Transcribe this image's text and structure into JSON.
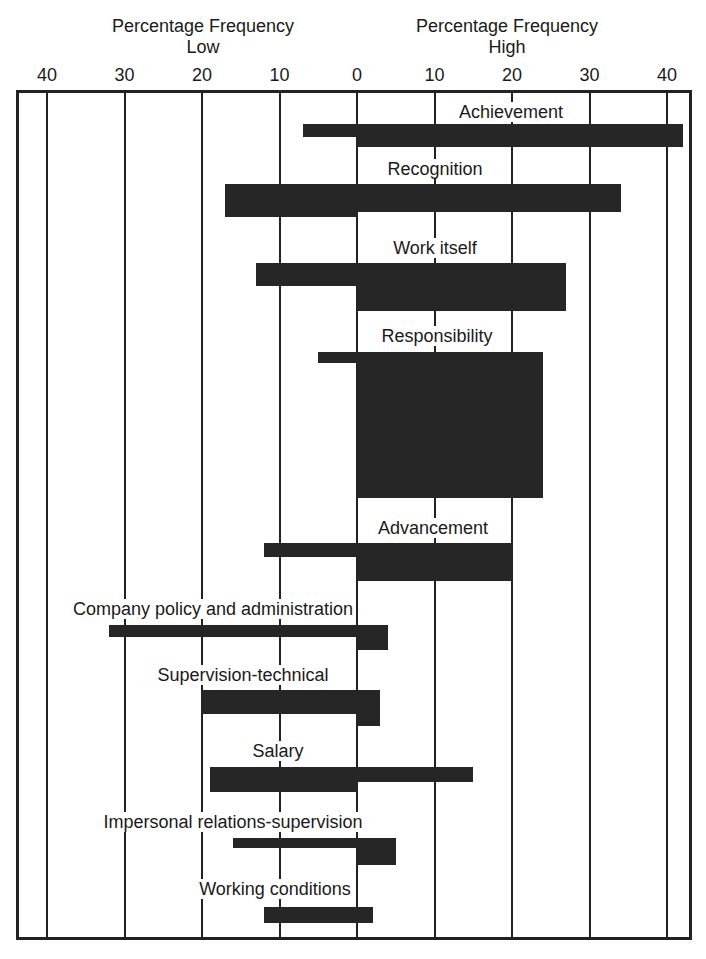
{
  "header": {
    "low_title_line1": "Percentage Frequency",
    "low_title_line2": "Low",
    "high_title_line1": "Percentage Frequency",
    "high_title_line2": "High"
  },
  "chart_data": {
    "type": "bar",
    "orientation": "horizontal-diverging",
    "title": "",
    "xlabel_left": "Percentage Frequency Low",
    "xlabel_right": "Percentage Frequency High",
    "tick_labels": [
      "40",
      "30",
      "20",
      "10",
      "0",
      "10",
      "20",
      "30",
      "40"
    ],
    "xlim_low": [
      0,
      40
    ],
    "xlim_high": [
      0,
      40
    ],
    "grid": true,
    "legend": null,
    "categories": [
      "Achievement",
      "Recognition",
      "Work itself",
      "Responsibility",
      "Advancement",
      "Company policy and administration",
      "Supervision-technical",
      "Salary",
      "Impersonal relations-supervision",
      "Working conditions"
    ],
    "series": [
      {
        "name": "Low",
        "values": [
          7,
          17,
          13,
          5,
          12,
          32,
          20,
          19,
          16,
          12
        ]
      },
      {
        "name": "High",
        "values": [
          42,
          34,
          27,
          24,
          20,
          4,
          3,
          15,
          5,
          2
        ]
      }
    ]
  },
  "bars": [
    {
      "label": "Achievement",
      "low": 7,
      "high": 42,
      "top": 124,
      "low_bottom": 137,
      "high_bottom": 147,
      "label_x": 511,
      "label_y": 102
    },
    {
      "label": "Recognition",
      "low": 17,
      "high": 34,
      "top": 184,
      "low_bottom": 217,
      "high_bottom": 212,
      "label_x": 435,
      "label_y": 159
    },
    {
      "label": "Work itself",
      "low": 13,
      "high": 27,
      "top": 263,
      "low_bottom": 286,
      "high_bottom": 311,
      "label_x": 435,
      "label_y": 238
    },
    {
      "label": "Responsibility",
      "low": 5,
      "high": 24,
      "top": 352,
      "low_bottom": 363,
      "high_bottom": 498,
      "label_x": 437,
      "label_y": 326
    },
    {
      "label": "Advancement",
      "low": 12,
      "high": 20,
      "top": 543,
      "low_bottom": 557,
      "high_bottom": 581,
      "label_x": 433,
      "label_y": 518
    },
    {
      "label": "Company policy and administration",
      "low": 32,
      "high": 4,
      "top": 625,
      "low_bottom": 637,
      "high_bottom": 650,
      "label_x": 213,
      "label_y": 599
    },
    {
      "label": "Supervision-technical",
      "low": 20,
      "high": 3,
      "top": 690,
      "low_bottom": 714,
      "high_bottom": 726,
      "label_x": 243,
      "label_y": 665
    },
    {
      "label": "Salary",
      "low": 19,
      "high": 15,
      "top": 767,
      "low_bottom": 792,
      "high_bottom": 782,
      "label_x": 278,
      "label_y": 741
    },
    {
      "label": "Impersonal relations-supervision",
      "low": 16,
      "high": 5,
      "top": 838,
      "low_bottom": 848,
      "high_bottom": 865,
      "label_x": 233,
      "label_y": 812
    },
    {
      "label": "Working conditions",
      "low": 12,
      "high": 2,
      "top": 907,
      "low_bottom": 923,
      "high_bottom": 923,
      "label_x": 275,
      "label_y": 879
    }
  ]
}
